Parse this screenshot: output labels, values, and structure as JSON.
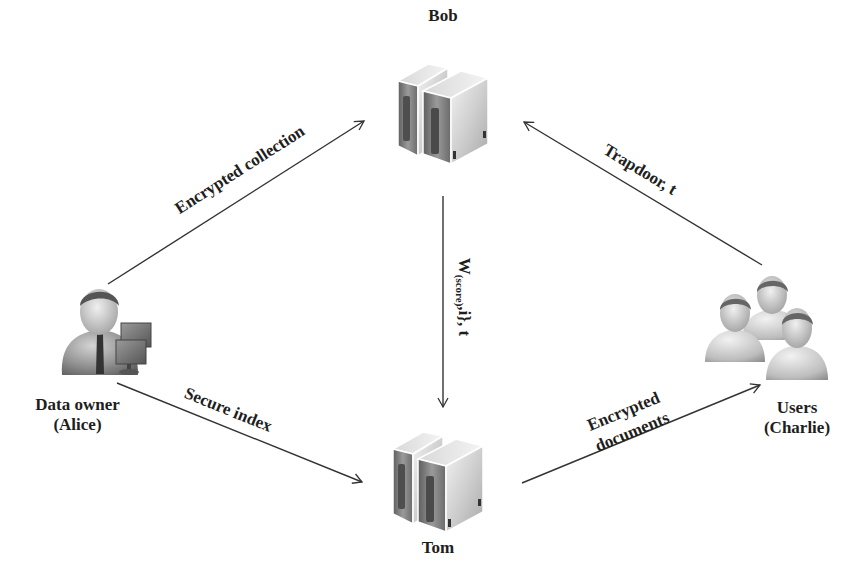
{
  "diagram": {
    "type": "data-flow",
    "nodes": [
      {
        "id": "bob",
        "label": "Bob",
        "icon": "server-icon"
      },
      {
        "id": "tom",
        "label": "Tom",
        "icon": "server-icon"
      },
      {
        "id": "alice",
        "label_line1": "Data owner",
        "label_line2": "(Alice)",
        "icon": "data-owner-icon"
      },
      {
        "id": "charlie",
        "label_line1": "Users",
        "label_line2": "(Charlie)",
        "icon": "users-group-icon"
      }
    ],
    "edges": [
      {
        "from": "alice",
        "to": "bob",
        "label": "Encrypted collection"
      },
      {
        "from": "charlie",
        "to": "bob",
        "label": "Trapdoor, t"
      },
      {
        "from": "bob",
        "to": "tom",
        "label_main": "W",
        "label_sub": "(score)",
        "label_rest": ",i}, t"
      },
      {
        "from": "alice",
        "to": "tom",
        "label": "Secure index"
      },
      {
        "from": "tom",
        "to": "charlie",
        "label_line1": "Encrypted",
        "label_line2": "documents"
      }
    ]
  },
  "colors": {
    "line": "#333333",
    "text": "#1e1e1e",
    "server_light": "#e6e6e6",
    "server_dark": "#7a7a7a",
    "person": "#8a8a8a"
  }
}
